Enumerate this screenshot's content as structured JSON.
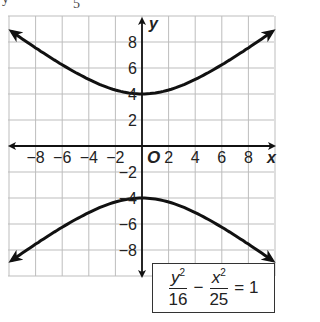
{
  "cropped_top_text": {
    "left": "y",
    "center": "5"
  },
  "chart_data": {
    "type": "line",
    "title": "",
    "xlabel": "x",
    "ylabel": "y",
    "origin_label": "O",
    "xlim": [
      -10,
      10
    ],
    "ylim": [
      -10,
      10
    ],
    "grid": true,
    "grid_step": 2,
    "x_ticks": [
      -8,
      -6,
      -4,
      -2,
      2,
      4,
      6,
      8
    ],
    "x_tick_labels": [
      "−8",
      "−6",
      "−4",
      "−2",
      "2",
      "4",
      "6",
      "8"
    ],
    "y_ticks": [
      8,
      6,
      4,
      2,
      -2,
      -4,
      -6,
      -8
    ],
    "y_tick_labels": [
      "8",
      "6",
      "4",
      "2",
      "−2",
      "−4",
      "−6",
      "−8"
    ],
    "series": [
      {
        "name": "upper branch",
        "equation": "y = 4*sqrt(1 + x^2/25)",
        "x": [
          -9.8,
          -8,
          -6,
          -4,
          -2,
          0,
          2,
          4,
          6,
          8,
          9.8
        ],
        "y": [
          8.8,
          7.55,
          6.25,
          5.12,
          4.31,
          4,
          4.31,
          5.12,
          6.25,
          7.55,
          8.8
        ],
        "arrows": "both"
      },
      {
        "name": "lower branch",
        "equation": "y = -4*sqrt(1 + x^2/25)",
        "x": [
          -9.8,
          -8,
          -6,
          -4,
          -2,
          0,
          2,
          4,
          6,
          8,
          9.8
        ],
        "y": [
          -8.8,
          -7.55,
          -6.25,
          -5.12,
          -4.31,
          -4,
          -4.31,
          -5.12,
          -6.25,
          -7.55,
          -8.8
        ],
        "arrows": "both"
      }
    ],
    "vertices": [
      [
        0,
        4
      ],
      [
        0,
        -4
      ]
    ],
    "annotation": "y²/16 − x²/25 = 1"
  },
  "equation": {
    "term1_num": "y",
    "term1_exp": "2",
    "term1_den": "16",
    "minus": "−",
    "term2_num": "x",
    "term2_exp": "2",
    "term2_den": "25",
    "equals": "= 1"
  },
  "style": {
    "curve_color": "#111111",
    "grid_color": "#bdbdbd",
    "axis_color": "#111111"
  }
}
